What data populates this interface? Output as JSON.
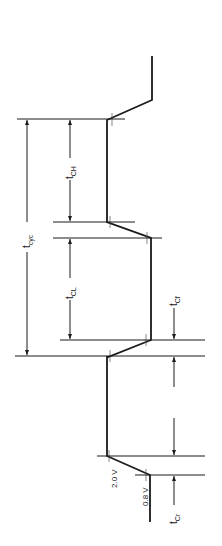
{
  "diagram": {
    "type": "clock timing diagram",
    "orientation": "rotated 90 degrees (time runs bottom to top)",
    "labels": {
      "tcyc": {
        "main": "t",
        "sub": "cyc"
      },
      "tch": {
        "main": "t",
        "sub": "CH"
      },
      "tcl": {
        "main": "t",
        "sub": "CL"
      },
      "tcf": {
        "main": "t",
        "sub": "Cf"
      },
      "tcr": {
        "main": "t",
        "sub": "Cr"
      }
    },
    "voltage_levels": {
      "high": "2.0 V",
      "low": "0.8 V"
    },
    "colors": {
      "line": "#1a1a1a",
      "background": "#ffffff"
    }
  }
}
